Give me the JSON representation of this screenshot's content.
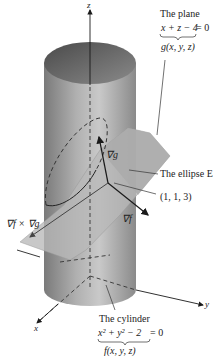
{
  "figure": {
    "axes": {
      "x": "x",
      "y": "y",
      "z": "z"
    },
    "plane_label": {
      "title": "The plane",
      "equation": "x + z − 4 = 0",
      "brace_expr": "x + z − 4",
      "rhs": "= 0",
      "function": "g(x, y, z)"
    },
    "cylinder_label": {
      "title": "The cylinder",
      "equation": "x² + y² − 2 = 0",
      "function": "f(x, y, z)"
    },
    "ellipse_label": "The ellipse E",
    "point_label": "(1, 1, 3)",
    "vectors": {
      "grad_g": "∇g",
      "grad_f": "∇f",
      "cross": "∇f × ∇g"
    },
    "colors": {
      "cylinder_dark": "#6e6e6e",
      "cylinder_light": "#c8c8c8",
      "plane": "#b4b4b4",
      "lines": "#1a1a1a"
    }
  }
}
